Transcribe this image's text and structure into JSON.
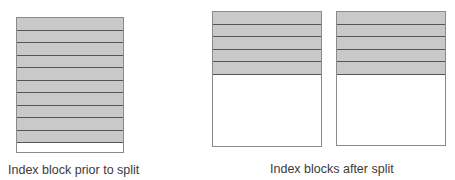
{
  "diagram": {
    "before": {
      "caption": "Index block prior to split",
      "filled_rows": 10,
      "empty_rows": 1
    },
    "after": {
      "caption": "Index blocks after split",
      "blocks": [
        {
          "filled_rows": 5
        },
        {
          "filled_rows": 5
        }
      ]
    },
    "colors": {
      "filled": "#c9c9c9",
      "empty": "#ffffff",
      "line": "#555555"
    }
  }
}
